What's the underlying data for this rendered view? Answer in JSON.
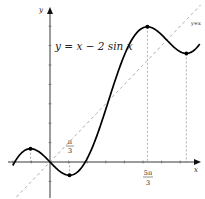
{
  "chart_data": {
    "type": "line",
    "title": "",
    "xlabel": "x",
    "ylabel": "y",
    "xlim": [
      -2.0,
      8.1
    ],
    "ylim": [
      -1.8,
      8.0
    ],
    "grid": false,
    "series": [
      {
        "name": "y = x − 2 sin x",
        "function": "x - 2*sin(x)",
        "style": "solid",
        "color": "#000000",
        "domain": [
          -2.0,
          8.05
        ]
      },
      {
        "name": "y=x",
        "function": "x",
        "style": "dashed",
        "color": "#999999",
        "domain": [
          -1.8,
          8.1
        ]
      }
    ],
    "critical_points": [
      {
        "x": -1.0472,
        "y": 0.6848,
        "label": "local max"
      },
      {
        "x": 1.0472,
        "y": -0.6848,
        "label": "local min"
      },
      {
        "x": 5.236,
        "y": 6.968,
        "label": "local max"
      },
      {
        "x": 7.3304,
        "y": 5.5984,
        "label": "local min"
      }
    ],
    "x_tick_labels": [
      {
        "value": 1.0472,
        "num": "π",
        "den": "3"
      },
      {
        "value": 5.236,
        "num": "5π",
        "den": "3"
      }
    ],
    "annotations": [
      {
        "text": "y = x − 2 sin x",
        "near": "upper-left"
      },
      {
        "text": "y=x",
        "near": "top-right"
      }
    ]
  }
}
